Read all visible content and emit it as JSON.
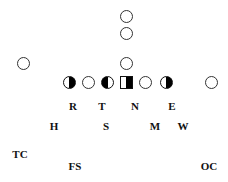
{
  "diagram": {
    "type": "football-formation",
    "offense_symbols": [
      {
        "id": "deep-back-1",
        "shape": "circle",
        "x": 126,
        "y": 16
      },
      {
        "id": "deep-back-2",
        "shape": "circle",
        "x": 126,
        "y": 33
      },
      {
        "id": "quarterback",
        "shape": "circle",
        "x": 126,
        "y": 63
      },
      {
        "id": "split-end-left",
        "shape": "circle",
        "x": 23,
        "y": 63
      },
      {
        "id": "left-tackle",
        "shape": "half-right",
        "x": 69,
        "y": 82
      },
      {
        "id": "left-guard",
        "shape": "circle",
        "x": 88,
        "y": 82
      },
      {
        "id": "left-inner",
        "shape": "half-left",
        "x": 107,
        "y": 82
      },
      {
        "id": "center",
        "shape": "square-half",
        "x": 126,
        "y": 82
      },
      {
        "id": "right-guard",
        "shape": "circle",
        "x": 145,
        "y": 82
      },
      {
        "id": "right-tackle",
        "shape": "half-right",
        "x": 166,
        "y": 82
      },
      {
        "id": "wide-receiver-right",
        "shape": "circle",
        "x": 211,
        "y": 82
      }
    ],
    "defense_labels": [
      {
        "text": "R",
        "x": 73,
        "y": 106
      },
      {
        "text": "T",
        "x": 102,
        "y": 106
      },
      {
        "text": "N",
        "x": 135,
        "y": 106
      },
      {
        "text": "E",
        "x": 172,
        "y": 106
      },
      {
        "text": "H",
        "x": 54,
        "y": 126
      },
      {
        "text": "S",
        "x": 106,
        "y": 126
      },
      {
        "text": "M",
        "x": 155,
        "y": 126
      },
      {
        "text": "W",
        "x": 183,
        "y": 126
      },
      {
        "text": "TC",
        "x": 20,
        "y": 154
      },
      {
        "text": "FS",
        "x": 75,
        "y": 166
      },
      {
        "text": "OC",
        "x": 209,
        "y": 166
      }
    ]
  }
}
